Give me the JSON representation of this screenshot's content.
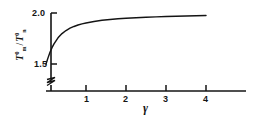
{
  "figure": {
    "background_color": "#ffffff",
    "ink_color": "#141414"
  },
  "chart_data": {
    "type": "line",
    "title": "",
    "subtitle": "",
    "xlabel": "γ",
    "ylabel": "T°m / T°n",
    "ylabel_parts": {
      "numerator_base": "T",
      "numerator_sup": "0",
      "numerator_sub": "m",
      "separator": "/",
      "denominator_base": "T",
      "denominator_sup": "0",
      "denominator_sub": "n"
    },
    "xlim": [
      0,
      4.95
    ],
    "ylim": [
      1.42,
      2.04
    ],
    "grid": false,
    "legend": null,
    "y_axis_break": true,
    "y_axis_break_note": "zigzag break between origin and 1.5 on the vertical axis",
    "xticks": [
      1,
      2,
      3,
      4
    ],
    "xticklabels": [
      "1",
      "2",
      "3",
      "4"
    ],
    "yticks": [
      1.5,
      2.0
    ],
    "yticklabels": [
      "1.5",
      "2.0"
    ],
    "series": [
      {
        "name": "T°m/T°n vs γ",
        "x": [
          0.0,
          0.05,
          0.1,
          0.15,
          0.2,
          0.3,
          0.4,
          0.5,
          0.6,
          0.7,
          0.8,
          0.9,
          1.0,
          1.2,
          1.4,
          1.6,
          1.8,
          2.0,
          2.25,
          2.5,
          2.75,
          3.0,
          3.25,
          3.5,
          3.75,
          4.0
        ],
        "y": [
          1.5,
          1.56,
          1.615,
          1.66,
          1.698,
          1.757,
          1.798,
          1.828,
          1.851,
          1.868,
          1.882,
          1.893,
          1.902,
          1.917,
          1.928,
          1.936,
          1.943,
          1.948,
          1.954,
          1.958,
          1.962,
          1.966,
          1.969,
          1.971,
          1.973,
          1.975
        ]
      }
    ]
  },
  "ticks": {
    "x": [
      {
        "label": "1",
        "value": 1
      },
      {
        "label": "2",
        "value": 2
      },
      {
        "label": "3",
        "value": 3
      },
      {
        "label": "4",
        "value": 4
      }
    ],
    "y": [
      {
        "label": "2.0",
        "value": 2.0
      },
      {
        "label": "1.5",
        "value": 1.5
      }
    ]
  }
}
